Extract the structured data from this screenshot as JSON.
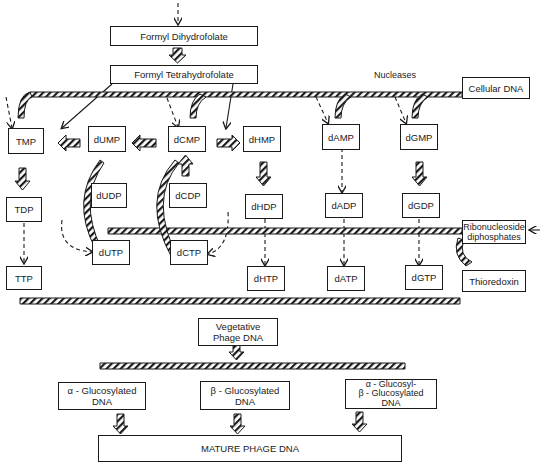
{
  "diagram": {
    "nodes": {
      "formyl_dihydrofolate": "Formyl Dihydrofolate",
      "formyl_tetrahydrofolate": "Formyl Tetrahydrofolate",
      "cellular_dna": "Cellular DNA",
      "nucleases": "Nucleases",
      "tmp": "TMP",
      "dump": "dUMP",
      "dcmp": "dCMP",
      "dhmp": "dHMP",
      "damp": "dAMP",
      "dgmp": "dGMP",
      "tdp": "TDP",
      "dudp": "dUDP",
      "dcdp": "dCDP",
      "dhdp": "dHDP",
      "dadp": "dADP",
      "dgdp": "dGDP",
      "ribonucleoside_diphosphates_1": "Ribonucleoside",
      "ribonucleoside_diphosphates_2": "diphosphates",
      "ttp": "TTP",
      "dutp": "dUTP",
      "dctp": "dCTP",
      "dhtp": "dHTP",
      "datp": "dATP",
      "dgtp": "dGTP",
      "thioredoxin": "Thioredoxin",
      "vegetative_1": "Vegetative",
      "vegetative_2": "Phage DNA",
      "alpha_gluc_1": "α - Glucosylated",
      "alpha_gluc_2": "DNA",
      "beta_gluc_1": "β - Glucosylated",
      "beta_gluc_2": "DNA",
      "ab_gluc_1": "α - Glucosyl-",
      "ab_gluc_2": "β - Glucosylated",
      "ab_gluc_3": "DNA",
      "mature": "MATURE PHAGE DNA"
    },
    "edge_styles": {
      "hatched_arrow": "enzymatic / main pathway",
      "dashed_arrow": "phosphorylation step",
      "solid_arrow": "formyl transfer"
    },
    "colors": {
      "ink": "#1a1a1a",
      "background": "#ffffff"
    }
  }
}
